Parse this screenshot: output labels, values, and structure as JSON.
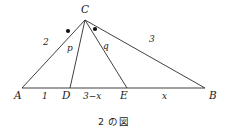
{
  "figure": {
    "caption": "2 の図",
    "vertices": [
      {
        "key": "A",
        "label": "A",
        "x": 22,
        "y": 88
      },
      {
        "key": "C",
        "label": "C",
        "x": 85,
        "y": 20
      },
      {
        "key": "B",
        "label": "B",
        "x": 205,
        "y": 88
      },
      {
        "key": "D",
        "label": "D",
        "x": 70,
        "y": 88
      },
      {
        "key": "E",
        "label": "E",
        "x": 127,
        "y": 88
      }
    ],
    "side_labels": [
      {
        "key": "AC",
        "label": "2",
        "x": 47,
        "y": 45
      },
      {
        "key": "CD",
        "label": "p",
        "x": 71,
        "y": 50
      },
      {
        "key": "CE",
        "label": "q",
        "x": 106,
        "y": 48
      },
      {
        "key": "CB",
        "label": "3",
        "x": 152,
        "y": 42
      }
    ],
    "base_labels": [
      {
        "key": "AD",
        "label": "1",
        "x": 45,
        "y": 93
      },
      {
        "key": "DE",
        "label": "3−x",
        "x": 93,
        "y": 93
      },
      {
        "key": "EB",
        "label": "x",
        "x": 165,
        "y": 93
      }
    ],
    "angle_marks": [
      {
        "key": "angle-ACD-mark",
        "x": 68,
        "y": 31
      },
      {
        "key": "angle-DCE-mark",
        "x": 95,
        "y": 29
      }
    ],
    "colors": {
      "stroke": "#2b2b2b",
      "text": "#1a1a1a",
      "background": "#ffffff",
      "dot": "#111111"
    }
  }
}
